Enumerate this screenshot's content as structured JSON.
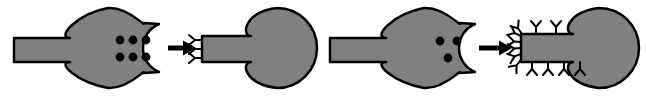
{
  "figure": {
    "type": "schematic-diagram",
    "width": 646,
    "height": 96,
    "background_color": "#ffffff",
    "shape_fill_color": "#808080",
    "outline_color": "#000000",
    "dot_color": "#000000",
    "marker_color": "#000000",
    "outline_width": 2.5,
    "panel_count": 4,
    "arrow_count": 2
  },
  "panels": [
    {
      "id": "panel-1",
      "name": "receptor-high-density",
      "role": "reactant",
      "shape": "c-shaped-receptor-with-tail",
      "tail": {
        "x": 14,
        "y": 38,
        "width": 68,
        "height": 24
      },
      "head": {
        "cx": 110,
        "cy": 48,
        "rx": 36,
        "ry": 40
      },
      "notch": {
        "cx": 133,
        "cy": 48,
        "rx": 24,
        "ry": 24,
        "opens": "right"
      },
      "dot_count": 6,
      "dot_radius": 4.4,
      "dot_layout": "2-rows-of-3",
      "dots": [
        {
          "cx": 120,
          "cy": 40
        },
        {
          "cx": 133,
          "cy": 40
        },
        {
          "cx": 146,
          "cy": 40
        },
        {
          "cx": 120,
          "cy": 57
        },
        {
          "cx": 133,
          "cy": 57
        },
        {
          "cx": 146,
          "cy": 57
        }
      ]
    },
    {
      "id": "panel-2",
      "name": "product-low-marker-density",
      "role": "product",
      "shape": "bulb-with-tail",
      "tail": {
        "x": 202,
        "y": 36,
        "width": 72,
        "height": 26
      },
      "head": {
        "cx": 283,
        "cy": 48,
        "rx": 40,
        "ry": 40
      },
      "marker_count": 3,
      "marker_glyph": "Y",
      "markers": [
        {
          "x": 202,
          "y": 40,
          "side": "left",
          "rotation": -90
        },
        {
          "x": 202,
          "y": 49,
          "side": "left",
          "rotation": -90
        },
        {
          "x": 202,
          "y": 58,
          "side": "left",
          "rotation": -90
        }
      ]
    },
    {
      "id": "panel-3",
      "name": "receptor-low-density",
      "role": "reactant",
      "shape": "c-shaped-receptor-with-tail",
      "tail": {
        "x": 330,
        "y": 38,
        "width": 68,
        "height": 24
      },
      "head": {
        "cx": 426,
        "cy": 48,
        "rx": 36,
        "ry": 40
      },
      "notch": {
        "cx": 449,
        "cy": 48,
        "rx": 24,
        "ry": 24,
        "opens": "right"
      },
      "dot_count": 3,
      "dot_radius": 4.4,
      "dot_layout": "triangle-2-top-1-bottom",
      "dots": [
        {
          "cx": 440,
          "cy": 41
        },
        {
          "cx": 457,
          "cy": 41
        },
        {
          "cx": 448,
          "cy": 58
        }
      ]
    },
    {
      "id": "panel-4",
      "name": "product-high-marker-density",
      "role": "product",
      "shape": "bulb-with-tail",
      "tail": {
        "x": 521,
        "y": 34,
        "width": 76,
        "height": 28
      },
      "head": {
        "cx": 605,
        "cy": 48,
        "rx": 40,
        "ry": 40
      },
      "marker_count": 12,
      "marker_glyph": "Y",
      "markers": [
        {
          "x": 536,
          "y": 34,
          "side": "top",
          "rotation": 0
        },
        {
          "x": 556,
          "y": 34,
          "side": "top",
          "rotation": 0
        },
        {
          "x": 522,
          "y": 34,
          "side": "top-left-corner",
          "rotation": -35
        },
        {
          "x": 521,
          "y": 36,
          "side": "left",
          "rotation": -65
        },
        {
          "x": 521,
          "y": 42,
          "side": "left",
          "rotation": -85
        },
        {
          "x": 521,
          "y": 48,
          "side": "left",
          "rotation": -95
        },
        {
          "x": 521,
          "y": 54,
          "side": "left",
          "rotation": -110
        },
        {
          "x": 521,
          "y": 60,
          "side": "bottom-left-corner",
          "rotation": -140
        },
        {
          "x": 532,
          "y": 62,
          "side": "bottom",
          "rotation": 180
        },
        {
          "x": 548,
          "y": 62,
          "side": "bottom",
          "rotation": 180
        },
        {
          "x": 564,
          "y": 62,
          "side": "bottom",
          "rotation": 180
        },
        {
          "x": 580,
          "y": 62,
          "side": "bottom",
          "rotation": 180
        }
      ]
    }
  ],
  "arrows": [
    {
      "id": "arrow-1",
      "name": "transformation-arrow-1",
      "direction": "right",
      "x1": 168,
      "y": 48,
      "x2": 196,
      "shaft_width": 5,
      "head_length": 13,
      "head_width": 15
    },
    {
      "id": "arrow-2",
      "name": "transformation-arrow-2",
      "direction": "right",
      "x1": 479,
      "y": 48,
      "x2": 512,
      "shaft_width": 5,
      "head_length": 13,
      "head_width": 15
    }
  ]
}
